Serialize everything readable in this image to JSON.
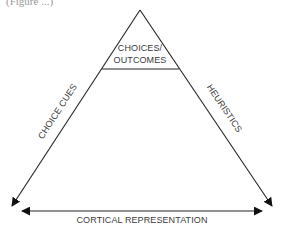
{
  "diagram": {
    "top_fragment": "(Figure ...)",
    "apex_label_line1": "CHOICES/",
    "apex_label_line2": "OUTCOMES",
    "left_side_label": "CHOICE CUES",
    "right_side_label": "HEURISTICS",
    "base_label": "CORTICAL REPRESENTATION",
    "colors": {
      "line": "#222222",
      "text": "#3a3a3a",
      "background": "#ffffff"
    }
  }
}
